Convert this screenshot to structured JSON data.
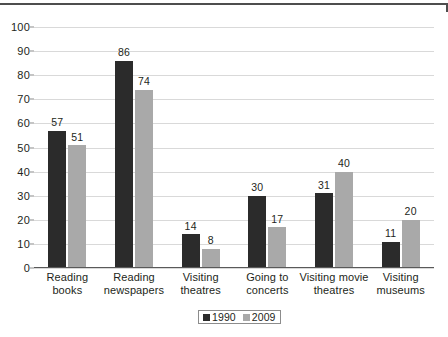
{
  "chart_data": {
    "type": "bar",
    "title": "",
    "subtitle": "",
    "xlabel": "",
    "ylabel": "",
    "ylim": [
      0,
      100
    ],
    "ytick_step": 10,
    "yticks": [
      "0",
      "10",
      "20",
      "30",
      "40",
      "50",
      "60",
      "70",
      "80",
      "90",
      "100"
    ],
    "grid": true,
    "legend_position": "bottom-center",
    "categories": [
      "Reading books",
      "Reading newspapers",
      "Visiting theatres",
      "Going to concerts",
      "Visiting movie theatres",
      "Visiting museums"
    ],
    "category_lines": [
      [
        "Reading",
        "books"
      ],
      [
        "Reading",
        "newspapers"
      ],
      [
        "Visiting",
        "theatres"
      ],
      [
        "Going to",
        "concerts"
      ],
      [
        "Visiting movie",
        "theatres"
      ],
      [
        "Visiting",
        "museums"
      ]
    ],
    "series": [
      {
        "name": "1990",
        "color": "#2b2b2b",
        "values": [
          57,
          86,
          14,
          30,
          31,
          11
        ],
        "labels": [
          "57",
          "86",
          "14",
          "30",
          "31",
          "11"
        ]
      },
      {
        "name": "2009",
        "color": "#a9a9a9",
        "values": [
          51,
          74,
          8,
          17,
          40,
          20
        ],
        "labels": [
          "51",
          "74",
          "8",
          "17",
          "40",
          "20"
        ]
      }
    ]
  },
  "legend": {
    "items": [
      {
        "label": "1990",
        "color": "#2b2b2b"
      },
      {
        "label": "2009",
        "color": "#a9a9a9"
      }
    ]
  },
  "colors": {
    "series_1990": "#2b2b2b",
    "series_2009": "#a9a9a9",
    "gridline": "#d9d9d9",
    "axis": "#595959",
    "text": "#231f20",
    "page_rule": "#4d4d4d"
  }
}
